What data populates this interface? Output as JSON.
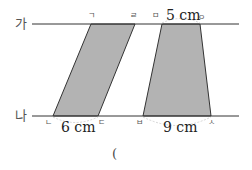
{
  "diagram": {
    "lines": {
      "top_label": "가",
      "bottom_label": "나"
    },
    "parallelogram": {
      "vertices": [
        "ㄱ",
        "ㄹ",
        "ㄷ",
        "ㄴ"
      ],
      "base_label": "6 cm"
    },
    "trapezoid": {
      "vertices": [
        "ㅁ",
        "ㅇ",
        "ㅅ",
        "ㅂ"
      ],
      "top_label": "5 cm",
      "base_label": "9 cm"
    },
    "answer_paren": "("
  },
  "colors": {
    "fill": "#b3b3b3",
    "line": "#333333"
  }
}
